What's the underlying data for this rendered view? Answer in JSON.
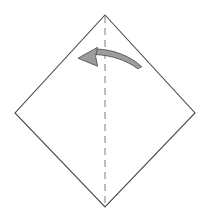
{
  "diagram": {
    "kind": "origami-fold-step",
    "canvas": {
      "width": 208,
      "height": 218,
      "background": "#ffffff"
    },
    "shapes": {
      "paper": {
        "name": "square-sheet-diamond-orientation",
        "points": "105,15 195,113 105,207 15,113",
        "fill": "#ffffff",
        "stroke": "#4a4a4a",
        "stroke_width": 1.1
      },
      "crease": {
        "name": "vertical-fold-line",
        "x1": 105,
        "y1": 16,
        "x2": 105,
        "y2": 206,
        "stroke": "#8a8a8a",
        "stroke_width": 1.1,
        "dash": "7 5",
        "style": "dashed"
      },
      "arrow": {
        "name": "fold-direction-arrow",
        "direction": "right-to-left",
        "body_path": "M 141.5 66.5 C 131 56.5 114 49.5 96 49.0 L 96 54.5 C 112 55.5 127 60.5 137.5 68.5 Z",
        "head_path": "M 78 58.2 L 97.5 47.4 L 95.6 56.6 L 97.6 66.2 Z",
        "fill": "#9c9c9c",
        "stroke": "#5e5e5e",
        "stroke_width": 1.0,
        "tip": {
          "x": 78,
          "y": 58
        },
        "tail": {
          "x": 142,
          "y": 67
        }
      }
    },
    "labels": {
      "caption": "",
      "step_number": ""
    }
  }
}
